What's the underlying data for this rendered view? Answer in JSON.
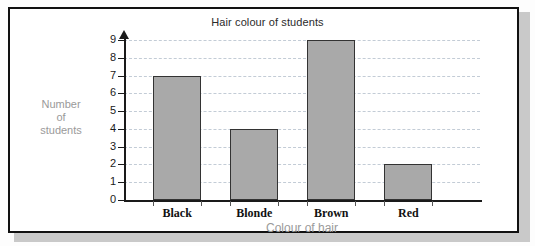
{
  "chart_data": {
    "type": "bar",
    "title": "Hair colour of students",
    "xlabel": "Colour of hair",
    "ylabel": "Number of students",
    "ylabel_lines": [
      "Number",
      "of",
      "students"
    ],
    "categories": [
      "Black",
      "Blonde",
      "Brown",
      "Red"
    ],
    "values": [
      7,
      4,
      9,
      2
    ],
    "ylim": [
      0,
      9
    ],
    "ytick_labels": [
      "0",
      "1",
      "2",
      "3",
      "4",
      "5",
      "6",
      "7",
      "8",
      "9"
    ],
    "grid": true,
    "grid_style": "dashed",
    "legend": null,
    "colors": {
      "bar_fill": "#a9a9a9",
      "bar_edge": "#333333",
      "grid": "#c3ccd6",
      "axis": "#1a1a1a",
      "axis_title_text": "#9a9a9a",
      "title_text": "#2b2b2b",
      "frame": "#111111",
      "shadow": "#c9c9c9"
    }
  }
}
